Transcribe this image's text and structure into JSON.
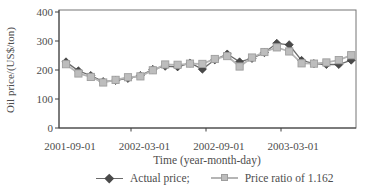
{
  "figure": {
    "background": "#ffffff"
  },
  "colors": {
    "text": "#4d4d4d",
    "axis_line": "#3f3f3f",
    "plot_border": "#757575",
    "actual_line": "#6b6b6b",
    "actual_marker_fill": "#4a4a4a",
    "actual_marker_edge": "#2e2e2e",
    "ratio_line": "#b5b5b5",
    "ratio_marker_fill": "#bdbdbd",
    "ratio_marker_edge": "#9e9e9e"
  },
  "chart_data": {
    "type": "line",
    "title": "",
    "xlabel": "Time (year-month-day)",
    "ylabel": "Oil price/(US$/ton)",
    "ylim": [
      0,
      400
    ],
    "yticks": [
      0,
      100,
      200,
      300,
      400
    ],
    "grid": false,
    "legend_position": "bottom",
    "categories": [
      "2001-09-01",
      "2001-10-01",
      "2001-11-01",
      "2001-12-01",
      "2002-01-01",
      "2002-02-01",
      "2002-03-01",
      "2002-04-01",
      "2002-05-01",
      "2002-06-01",
      "2002-07-01",
      "2002-08-01",
      "2002-09-01",
      "2002-10-01",
      "2002-11-01",
      "2002-12-01",
      "2003-01-01",
      "2003-02-01",
      "2003-03-01",
      "2003-04-01",
      "2003-05-01",
      "2003-06-01",
      "2003-07-01",
      "2003-08-01"
    ],
    "xtick_labels": [
      "2001-09-01",
      "2002-03-01",
      "2002-09-01",
      "2003-03-01"
    ],
    "xtick_indices": [
      0,
      6,
      12,
      18
    ],
    "series": [
      {
        "name": "Actual price;",
        "marker": "diamond",
        "values": [
          228,
          197,
          181,
          160,
          164,
          171,
          181,
          202,
          213,
          211,
          224,
          203,
          235,
          255,
          228,
          240,
          260,
          292,
          287,
          233,
          222,
          219,
          219,
          234
        ]
      },
      {
        "name": "Price ratio of 1.162",
        "marker": "square",
        "values": [
          220,
          188,
          176,
          157,
          166,
          175,
          178,
          199,
          219,
          218,
          222,
          221,
          238,
          248,
          212,
          243,
          262,
          278,
          264,
          223,
          222,
          226,
          234,
          251
        ]
      }
    ]
  },
  "legend": {
    "items": [
      {
        "label": "Actual price;",
        "marker": "diamond"
      },
      {
        "label": "Price ratio of 1.162",
        "marker": "square"
      }
    ]
  }
}
